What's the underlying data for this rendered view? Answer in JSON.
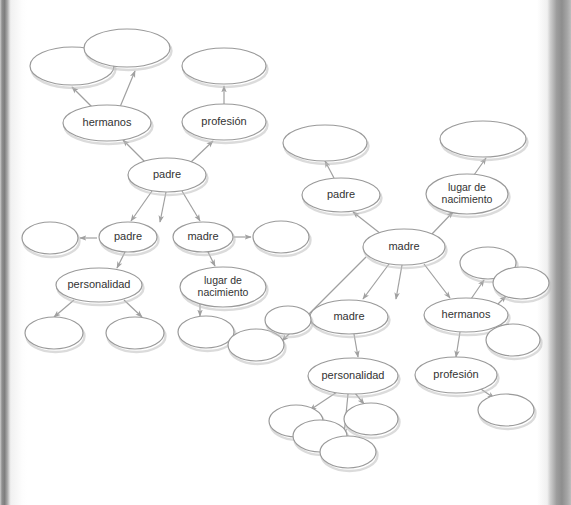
{
  "page": {
    "background_color": "#ffffff",
    "ellipse_stroke_color": "#9a9a9a",
    "ellipse_fill_color": "#ffffff",
    "ellipse_shadow_color": "#bdbdbd",
    "arrow_color": "#a0a0a0",
    "label_color": "#333333"
  },
  "nodes": [
    {
      "id": "n01",
      "label": "",
      "cx": 72,
      "cy": 66,
      "rx": 42,
      "ry": 19,
      "lines": []
    },
    {
      "id": "n02",
      "label": "",
      "cx": 127,
      "cy": 48,
      "rx": 43,
      "ry": 19,
      "lines": []
    },
    {
      "id": "n03",
      "label": "hermanos",
      "cx": 107,
      "cy": 123,
      "rx": 44,
      "ry": 18,
      "lines": [
        "hermanos"
      ]
    },
    {
      "id": "n04",
      "label": "",
      "cx": 224,
      "cy": 66,
      "rx": 42,
      "ry": 18,
      "lines": []
    },
    {
      "id": "n05",
      "label": "profesión",
      "cx": 224,
      "cy": 122,
      "rx": 42,
      "ry": 18,
      "lines": [
        "profesión"
      ]
    },
    {
      "id": "n06",
      "label": "padre",
      "cx": 167,
      "cy": 175,
      "rx": 39,
      "ry": 17,
      "lines": [
        "padre"
      ]
    },
    {
      "id": "n07",
      "label": "padre",
      "cx": 128,
      "cy": 237,
      "rx": 29,
      "ry": 15,
      "lines": [
        "padre"
      ]
    },
    {
      "id": "n08",
      "label": "madre",
      "cx": 203,
      "cy": 237,
      "rx": 30,
      "ry": 15,
      "lines": [
        "madre"
      ]
    },
    {
      "id": "n09",
      "label": "",
      "cx": 50,
      "cy": 238,
      "rx": 28,
      "ry": 16,
      "lines": []
    },
    {
      "id": "n10",
      "label": "",
      "cx": 281,
      "cy": 237,
      "rx": 28,
      "ry": 16,
      "lines": []
    },
    {
      "id": "n11",
      "label": "personalidad",
      "cx": 99,
      "cy": 285,
      "rx": 43,
      "ry": 17,
      "lines": [
        "personalidad"
      ]
    },
    {
      "id": "n12",
      "label": "lugar de nacimiento",
      "cx": 223,
      "cy": 287,
      "rx": 43,
      "ry": 20,
      "lines": [
        "lugar de",
        "nacimiento"
      ]
    },
    {
      "id": "n13",
      "label": "",
      "cx": 54,
      "cy": 333,
      "rx": 29,
      "ry": 16,
      "lines": []
    },
    {
      "id": "n14",
      "label": "",
      "cx": 135,
      "cy": 333,
      "rx": 29,
      "ry": 16,
      "lines": []
    },
    {
      "id": "n15",
      "label": "",
      "cx": 206,
      "cy": 332,
      "rx": 28,
      "ry": 16,
      "lines": []
    },
    {
      "id": "n16",
      "label": "",
      "cx": 256,
      "cy": 345,
      "rx": 28,
      "ry": 16,
      "lines": []
    },
    {
      "id": "n17",
      "label": "",
      "cx": 325,
      "cy": 143,
      "rx": 42,
      "ry": 18,
      "lines": []
    },
    {
      "id": "n18",
      "label": "padre",
      "cx": 341,
      "cy": 195,
      "rx": 39,
      "ry": 17,
      "lines": [
        "padre"
      ]
    },
    {
      "id": "n19",
      "label": "",
      "cx": 483,
      "cy": 139,
      "rx": 43,
      "ry": 18,
      "lines": []
    },
    {
      "id": "n20",
      "label": "lugar de nacimiento",
      "cx": 467,
      "cy": 194,
      "rx": 41,
      "ry": 20,
      "lines": [
        "lugar de",
        "nacimiento"
      ]
    },
    {
      "id": "n21",
      "label": "madre",
      "cx": 404,
      "cy": 247,
      "rx": 41,
      "ry": 18,
      "lines": [
        "madre"
      ]
    },
    {
      "id": "n22",
      "label": "",
      "cx": 488,
      "cy": 263,
      "rx": 28,
      "ry": 16,
      "lines": []
    },
    {
      "id": "n23",
      "label": "",
      "cx": 521,
      "cy": 283,
      "rx": 28,
      "ry": 16,
      "lines": []
    },
    {
      "id": "n24",
      "label": "madre",
      "cx": 349,
      "cy": 317,
      "rx": 39,
      "ry": 17,
      "lines": [
        "madre"
      ]
    },
    {
      "id": "n25",
      "label": "hermanos",
      "cx": 466,
      "cy": 315,
      "rx": 42,
      "ry": 17,
      "lines": [
        "hermanos"
      ]
    },
    {
      "id": "n26",
      "label": "",
      "cx": 288,
      "cy": 320,
      "rx": 23,
      "ry": 14,
      "lines": []
    },
    {
      "id": "n27",
      "label": "",
      "cx": 513,
      "cy": 340,
      "rx": 27,
      "ry": 16,
      "lines": []
    },
    {
      "id": "n28",
      "label": "personalidad",
      "cx": 353,
      "cy": 376,
      "rx": 45,
      "ry": 18,
      "lines": [
        "personalidad"
      ]
    },
    {
      "id": "n29",
      "label": "profesión",
      "cx": 456,
      "cy": 375,
      "rx": 41,
      "ry": 18,
      "lines": [
        "profesión"
      ]
    },
    {
      "id": "n30",
      "label": "",
      "cx": 506,
      "cy": 410,
      "rx": 28,
      "ry": 16,
      "lines": []
    },
    {
      "id": "n31",
      "label": "",
      "cx": 296,
      "cy": 421,
      "rx": 27,
      "ry": 16,
      "lines": []
    },
    {
      "id": "n32",
      "label": "",
      "cx": 320,
      "cy": 436,
      "rx": 27,
      "ry": 16,
      "lines": []
    },
    {
      "id": "n33",
      "label": "",
      "cx": 371,
      "cy": 419,
      "rx": 27,
      "ry": 16,
      "lines": []
    },
    {
      "id": "n34",
      "label": "",
      "cx": 348,
      "cy": 452,
      "rx": 28,
      "ry": 16,
      "lines": []
    }
  ],
  "edges": [
    {
      "from": "n03",
      "to": "n01",
      "x1": 92,
      "y1": 107,
      "x2": 72,
      "y2": 87
    },
    {
      "from": "n03",
      "to": "n02",
      "x1": 120,
      "y1": 107,
      "x2": 135,
      "y2": 71
    },
    {
      "from": "n06",
      "to": "n03",
      "x1": 147,
      "y1": 164,
      "x2": 123,
      "y2": 140
    },
    {
      "from": "n06",
      "to": "n05",
      "x1": 190,
      "y1": 163,
      "x2": 213,
      "y2": 141
    },
    {
      "from": "n05",
      "to": "n04",
      "x1": 224,
      "y1": 104,
      "x2": 224,
      "y2": 86
    },
    {
      "from": "n06",
      "to": "n07",
      "x1": 152,
      "y1": 191,
      "x2": 131,
      "y2": 221
    },
    {
      "from": "n06",
      "to": "n08",
      "x1": 182,
      "y1": 191,
      "x2": 200,
      "y2": 221
    },
    {
      "from": "n06",
      "to": "n11",
      "x1": 166,
      "y1": 192,
      "x2": 160,
      "y2": 222
    },
    {
      "from": "n07",
      "to": "n09",
      "x1": 97,
      "y1": 238,
      "x2": 80,
      "y2": 238
    },
    {
      "from": "n08",
      "to": "n10",
      "x1": 234,
      "y1": 237,
      "x2": 251,
      "y2": 237
    },
    {
      "from": "n07",
      "to": "n11",
      "x1": 125,
      "y1": 252,
      "x2": 117,
      "y2": 268
    },
    {
      "from": "n08",
      "to": "n12",
      "x1": 208,
      "y1": 252,
      "x2": 215,
      "y2": 266
    },
    {
      "from": "n11",
      "to": "n13",
      "x1": 74,
      "y1": 300,
      "x2": 54,
      "y2": 317
    },
    {
      "from": "n11",
      "to": "n14",
      "x1": 124,
      "y1": 300,
      "x2": 142,
      "y2": 317
    },
    {
      "from": "n12",
      "to": "n15",
      "x1": 200,
      "y1": 303,
      "x2": 200,
      "y2": 316
    },
    {
      "from": "n21",
      "to": "n16",
      "x1": 366,
      "y1": 257,
      "x2": 282,
      "y2": 341
    },
    {
      "from": "n18",
      "to": "n17",
      "x1": 334,
      "y1": 178,
      "x2": 325,
      "y2": 161
    },
    {
      "from": "n20",
      "to": "n19",
      "x1": 474,
      "y1": 175,
      "x2": 486,
      "y2": 158
    },
    {
      "from": "n21",
      "to": "n18",
      "x1": 381,
      "y1": 234,
      "x2": 353,
      "y2": 212
    },
    {
      "from": "n21",
      "to": "n20",
      "x1": 431,
      "y1": 235,
      "x2": 453,
      "y2": 212
    },
    {
      "from": "n21",
      "to": "n24",
      "x1": 389,
      "y1": 264,
      "x2": 363,
      "y2": 299
    },
    {
      "from": "n21",
      "to": "n28",
      "x1": 402,
      "y1": 265,
      "x2": 396,
      "y2": 299
    },
    {
      "from": "n21",
      "to": "n25",
      "x1": 424,
      "y1": 264,
      "x2": 450,
      "y2": 298
    },
    {
      "from": "n24",
      "to": "n26",
      "x1": 316,
      "y1": 321,
      "x2": 306,
      "y2": 322
    },
    {
      "from": "n24",
      "to": "n28",
      "x1": 354,
      "y1": 334,
      "x2": 358,
      "y2": 357
    },
    {
      "from": "n25",
      "to": "n22",
      "x1": 471,
      "y1": 299,
      "x2": 484,
      "y2": 280
    },
    {
      "from": "n25",
      "to": "n23",
      "x1": 492,
      "y1": 310,
      "x2": 506,
      "y2": 296
    },
    {
      "from": "n25",
      "to": "n27",
      "x1": 492,
      "y1": 322,
      "x2": 504,
      "y2": 331
    },
    {
      "from": "n25",
      "to": "n29",
      "x1": 460,
      "y1": 332,
      "x2": 456,
      "y2": 357
    },
    {
      "from": "n29",
      "to": "n30",
      "x1": 478,
      "y1": 387,
      "x2": 494,
      "y2": 398
    },
    {
      "from": "n28",
      "to": "n31",
      "x1": 337,
      "y1": 392,
      "x2": 310,
      "y2": 410
    },
    {
      "from": "n28",
      "to": "n33",
      "x1": 355,
      "y1": 393,
      "x2": 364,
      "y2": 404
    },
    {
      "from": "n28",
      "to": "n34",
      "x1": 348,
      "y1": 394,
      "x2": 344,
      "y2": 435
    }
  ]
}
